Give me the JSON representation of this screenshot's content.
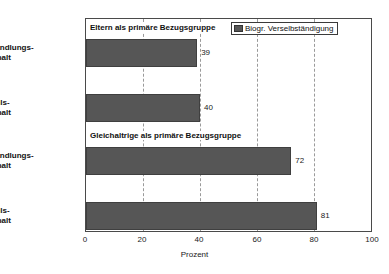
{
  "chart_data": {
    "type": "bar",
    "orientation": "horizontal",
    "title": "",
    "xlabel": "Prozent",
    "ylabel": "",
    "xlim": [
      0,
      100
    ],
    "xticks": [
      "0",
      "20",
      "40",
      "60",
      "80",
      "100"
    ],
    "grid": "vertical-dashed",
    "legend_position": "top-right",
    "series": [
      {
        "name": "Biogr. Verselbständigung",
        "color": "#565656",
        "values": [
          39,
          40,
          72,
          81
        ]
      }
    ],
    "categories": [
      "Verhandlungshaushalt",
      "Befehlshaushalt",
      "Verhandlungshaushalt",
      "Befehlshaushalt"
    ],
    "groups": [
      {
        "title": "Eltern als primäre Bezugsgruppe",
        "rows": [
          {
            "label_line1": "Verhandlungs-",
            "label_line2": "haushalt",
            "value": 39,
            "value_label": "39"
          },
          {
            "label_line1": "Befehls-",
            "label_line2": "haushalt",
            "value": 40,
            "value_label": "40"
          }
        ]
      },
      {
        "title": "Gleichaltrige als primäre Bezugsgruppe",
        "rows": [
          {
            "label_line1": "Verhandlungs-",
            "label_line2": "haushalt",
            "value": 72,
            "value_label": "72"
          },
          {
            "label_line1": "Befehls-",
            "label_line2": "haushalt",
            "value": 81,
            "value_label": "81"
          }
        ]
      }
    ]
  },
  "legend": {
    "entry_label": "Biogr. Verselbständigung",
    "swatch_color": "#565656"
  },
  "axis": {
    "x_title": "Prozent",
    "tick_0": "0",
    "tick_20": "20",
    "tick_40": "40",
    "tick_60": "60",
    "tick_80": "80",
    "tick_100": "100"
  },
  "groups": {
    "g0_title": "Eltern als primäre Bezugsgruppe",
    "g1_title": "Gleichaltrige als primäre Bezugsgruppe"
  },
  "rows": {
    "r0_l1": "Verhandlungs-",
    "r0_l2": "haushalt",
    "r0_val": "39",
    "r1_l1": "Befehls-",
    "r1_l2": "haushalt",
    "r1_val": "40",
    "r2_l1": "Verhandlungs-",
    "r2_l2": "haushalt",
    "r2_val": "72",
    "r3_l1": "Befehls-",
    "r3_l2": "haushalt",
    "r3_val": "81"
  }
}
